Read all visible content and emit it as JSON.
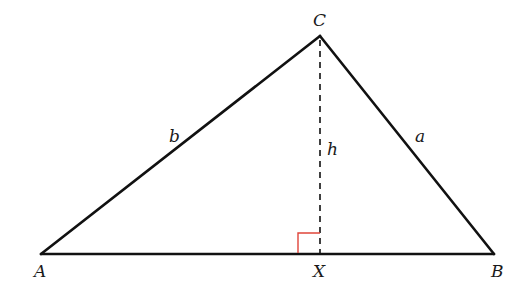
{
  "diagram": {
    "type": "triangle-with-altitude",
    "vertices": {
      "A": {
        "label": "A",
        "x": 41,
        "y": 254
      },
      "B": {
        "label": "B",
        "x": 494,
        "y": 254
      },
      "C": {
        "label": "C",
        "x": 320,
        "y": 36
      }
    },
    "foot": {
      "label": "X",
      "x": 320,
      "y": 254
    },
    "sides": {
      "a": {
        "label": "a",
        "from": "B",
        "to": "C"
      },
      "b": {
        "label": "b",
        "from": "A",
        "to": "C"
      }
    },
    "altitude": {
      "label": "h",
      "from": "C",
      "to": "X",
      "style": "dashed"
    },
    "right_angle_marker": {
      "color": "#e0453a",
      "size": 22
    },
    "colors": {
      "line": "#111111",
      "marker": "#e0453a"
    }
  }
}
